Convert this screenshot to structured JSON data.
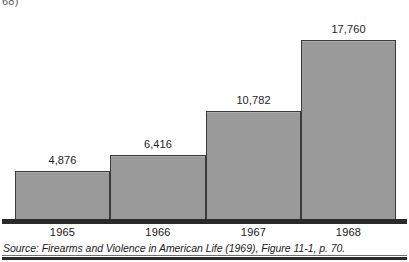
{
  "page": {
    "artifact_text": "68)"
  },
  "chart_data": {
    "type": "bar",
    "title": "",
    "subtitle": "",
    "xlabel": "",
    "ylabel": "",
    "categories": [
      "1965",
      "1966",
      "1967",
      "1968"
    ],
    "values": [
      4876,
      6416,
      10782,
      17760
    ],
    "value_labels": [
      "4,876",
      "6,416",
      "10,782",
      "17,760"
    ],
    "series": [
      {
        "name": "",
        "values": [
          4876,
          6416,
          10782,
          17760
        ]
      }
    ],
    "ylim": [
      0,
      19500
    ],
    "grid": false,
    "legend_position": "none",
    "bar_fill_color": "#9a9a9a",
    "bar_border_color": "#3b3b3b",
    "axis_color": "#2a2a2a",
    "annotations": []
  },
  "source": {
    "text": "Source: Firearms and Violence in American Life (1969), Figure 11-1, p. 70."
  }
}
